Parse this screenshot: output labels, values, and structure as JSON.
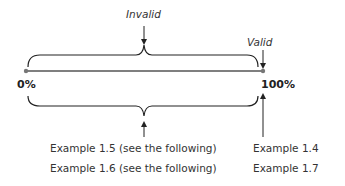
{
  "labels": {
    "invalid": "Invalid",
    "valid": "Valid",
    "start": "0%",
    "end": "100%"
  },
  "examples": {
    "left": [
      "Example 1.5 (see the following)",
      "Example 1.6 (see the following)"
    ],
    "right": [
      "Example 1.4",
      "Example 1.7"
    ]
  },
  "colors": {
    "line": "#555555",
    "endpoint": "#777777"
  }
}
